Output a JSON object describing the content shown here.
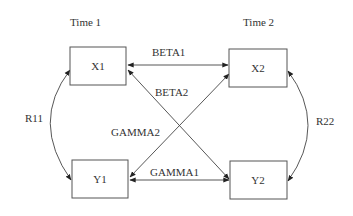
{
  "diagram": {
    "time_labels": [
      "Time 1",
      "Time 2"
    ],
    "nodes": {
      "x1": "X1",
      "x2": "X2",
      "y1": "Y1",
      "y2": "Y2"
    },
    "edges": {
      "beta1": "BETA1",
      "beta2": "BETA2",
      "gamma1": "GAMMA1",
      "gamma2": "GAMMA2",
      "r11": "R11",
      "r22": "R22"
    },
    "colors": {
      "line": "#444444",
      "box_border": "#555555",
      "text": "#333333",
      "background": "#ffffff"
    }
  }
}
